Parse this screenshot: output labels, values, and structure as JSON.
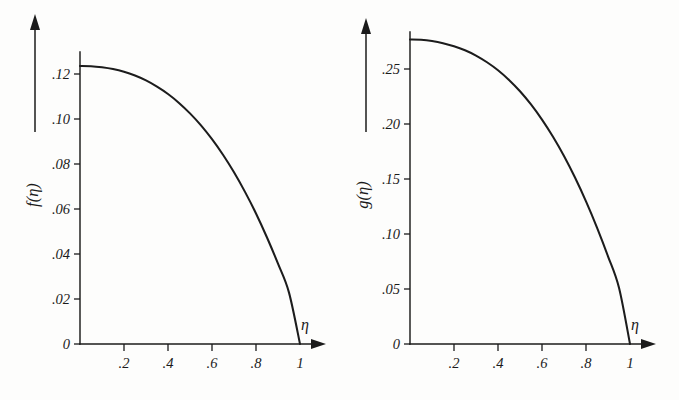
{
  "figure": {
    "background_color": "#fdfdfc",
    "ink_color": "#1b1b1b",
    "panel_count": 2
  },
  "chart_data": [
    {
      "type": "line",
      "panel": "left",
      "title": "",
      "xlabel": "η",
      "ylabel": "f(η)",
      "xlim": [
        0,
        1.08
      ],
      "ylim": [
        0,
        0.134
      ],
      "grid": false,
      "legend": "none",
      "xticks": [
        0.2,
        0.4,
        0.6,
        0.8,
        1
      ],
      "xticklabels": [
        ".2",
        ".4",
        ".6",
        ".8",
        "1"
      ],
      "yticks": [
        0,
        0.02,
        0.04,
        0.06,
        0.08,
        0.1,
        0.12
      ],
      "yticklabels": [
        "0",
        ".02",
        ".04",
        ".06",
        ".08",
        ".10",
        ".12"
      ],
      "origin_label": "0",
      "x": [
        0,
        0.05,
        0.1,
        0.15,
        0.2,
        0.25,
        0.3,
        0.35,
        0.4,
        0.45,
        0.5,
        0.55,
        0.6,
        0.65,
        0.7,
        0.75,
        0.8,
        0.85,
        0.9,
        0.95,
        1
      ],
      "y": [
        0.125,
        0.1249,
        0.1244,
        0.1236,
        0.1224,
        0.1207,
        0.1185,
        0.1157,
        0.1124,
        0.1084,
        0.1037,
        0.0983,
        0.0921,
        0.0851,
        0.0772,
        0.0684,
        0.0587,
        0.0479,
        0.0361,
        0.0231,
        0.0
      ],
      "peak_value": 0.125,
      "zero_crossing": 1.0,
      "series_name": "f(η)"
    },
    {
      "type": "line",
      "panel": "right",
      "title": "",
      "xlabel": "η",
      "ylabel": "g(η)",
      "xlim": [
        0,
        1.08
      ],
      "ylim": [
        0,
        0.295
      ],
      "grid": false,
      "legend": "none",
      "xticks": [
        0.2,
        0.4,
        0.6,
        0.8,
        1
      ],
      "xticklabels": [
        ".2",
        ".4",
        ".6",
        ".8",
        "1"
      ],
      "yticks": [
        0,
        0.05,
        0.1,
        0.15,
        0.2,
        0.25
      ],
      "yticklabels": [
        "0",
        ".05",
        ".10",
        ".15",
        ".20",
        ".25"
      ],
      "origin_label": "0",
      "x": [
        0,
        0.05,
        0.1,
        0.15,
        0.2,
        0.25,
        0.3,
        0.35,
        0.4,
        0.45,
        0.5,
        0.55,
        0.6,
        0.65,
        0.7,
        0.75,
        0.8,
        0.85,
        0.9,
        0.95,
        1
      ],
      "y": [
        0.277,
        0.2767,
        0.2756,
        0.2737,
        0.2709,
        0.2672,
        0.2624,
        0.2563,
        0.249,
        0.2402,
        0.2299,
        0.2179,
        0.2041,
        0.1885,
        0.171,
        0.1514,
        0.1297,
        0.1059,
        0.0798,
        0.0511,
        0.0
      ],
      "peak_value": 0.277,
      "zero_crossing": 1.0,
      "series_name": "g(η)"
    }
  ],
  "left_panel": {
    "y_axis_title": "f(η)",
    "x_axis_name": "η",
    "origin_label": "0",
    "x_tick_labels": [
      ".2",
      ".4",
      ".6",
      ".8",
      "1"
    ],
    "y_tick_labels": [
      ".02",
      ".04",
      ".06",
      ".08",
      ".10",
      ".12"
    ]
  },
  "right_panel": {
    "y_axis_title": "g(η)",
    "x_axis_name": "η",
    "origin_label": "0",
    "x_tick_labels": [
      ".2",
      ".4",
      ".6",
      ".8",
      "1"
    ],
    "y_tick_labels": [
      ".05",
      ".10",
      ".15",
      ".20",
      ".25"
    ]
  }
}
